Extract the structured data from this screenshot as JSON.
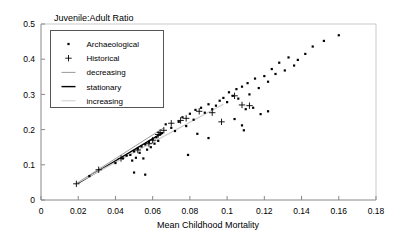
{
  "chart_data": {
    "type": "scatter",
    "title": "Juvenile:Adult Ratio",
    "xlabel": "Mean Childhood Mortality",
    "ylabel": "",
    "xlim": [
      0,
      0.18
    ],
    "ylim": [
      0,
      0.5
    ],
    "xticks": [
      0,
      0.02,
      0.04,
      0.06,
      0.08,
      0.1,
      0.12,
      0.14,
      0.16,
      0.18
    ],
    "xtick_labels": [
      "0",
      "0.02",
      "0.04",
      "0.06",
      "0.08",
      "0.1",
      "0.12",
      "0.14",
      "0.16",
      "0.18"
    ],
    "yticks": [
      0,
      0.1,
      0.2,
      0.3,
      0.4,
      0.5
    ],
    "ytick_labels": [
      "0",
      "0.1",
      "0.2",
      "0.3",
      "0.4",
      "0.5"
    ],
    "grid": false,
    "legend_position": "upper-left",
    "legend": [
      {
        "label": "Archaeological",
        "marker": "dot",
        "color": "#000000"
      },
      {
        "label": "Historical",
        "marker": "plus",
        "color": "#000000"
      },
      {
        "label": "decreasing",
        "marker": "line",
        "color": "#9a9a9a"
      },
      {
        "label": "stationary",
        "marker": "line",
        "color": "#000000"
      },
      {
        "label": "increasing",
        "marker": "line",
        "color": "#cccccc"
      }
    ],
    "series": [
      {
        "name": "Archaeological",
        "marker": "dot",
        "color": "#000000",
        "points": [
          [
            0.026,
            0.068
          ],
          [
            0.04,
            0.105
          ],
          [
            0.044,
            0.118
          ],
          [
            0.046,
            0.126
          ],
          [
            0.048,
            0.128
          ],
          [
            0.049,
            0.112
          ],
          [
            0.05,
            0.138
          ],
          [
            0.051,
            0.12
          ],
          [
            0.052,
            0.146
          ],
          [
            0.053,
            0.134
          ],
          [
            0.054,
            0.152
          ],
          [
            0.055,
            0.118
          ],
          [
            0.056,
            0.158
          ],
          [
            0.057,
            0.143
          ],
          [
            0.058,
            0.165
          ],
          [
            0.059,
            0.15
          ],
          [
            0.06,
            0.172
          ],
          [
            0.061,
            0.16
          ],
          [
            0.062,
            0.178
          ],
          [
            0.063,
            0.168
          ],
          [
            0.064,
            0.186
          ],
          [
            0.065,
            0.19
          ],
          [
            0.05,
            0.078
          ],
          [
            0.056,
            0.072
          ],
          [
            0.067,
            0.215
          ],
          [
            0.07,
            0.205
          ],
          [
            0.072,
            0.196
          ],
          [
            0.074,
            0.222
          ],
          [
            0.076,
            0.235
          ],
          [
            0.078,
            0.21
          ],
          [
            0.08,
            0.245
          ],
          [
            0.082,
            0.228
          ],
          [
            0.083,
            0.256
          ],
          [
            0.084,
            0.188
          ],
          [
            0.086,
            0.262
          ],
          [
            0.088,
            0.248
          ],
          [
            0.09,
            0.272
          ],
          [
            0.092,
            0.258
          ],
          [
            0.094,
            0.268
          ],
          [
            0.096,
            0.282
          ],
          [
            0.09,
            0.176
          ],
          [
            0.079,
            0.128
          ],
          [
            0.098,
            0.29
          ],
          [
            0.1,
            0.278
          ],
          [
            0.101,
            0.306
          ],
          [
            0.103,
            0.296
          ],
          [
            0.105,
            0.315
          ],
          [
            0.106,
            0.288
          ],
          [
            0.108,
            0.322
          ],
          [
            0.11,
            0.258
          ],
          [
            0.111,
            0.332
          ],
          [
            0.112,
            0.3
          ],
          [
            0.114,
            0.262
          ],
          [
            0.115,
            0.345
          ],
          [
            0.117,
            0.318
          ],
          [
            0.108,
            0.212
          ],
          [
            0.109,
            0.198
          ],
          [
            0.104,
            0.23
          ],
          [
            0.12,
            0.352
          ],
          [
            0.122,
            0.336
          ],
          [
            0.124,
            0.372
          ],
          [
            0.126,
            0.358
          ],
          [
            0.128,
            0.39
          ],
          [
            0.131,
            0.368
          ],
          [
            0.133,
            0.405
          ],
          [
            0.136,
            0.382
          ],
          [
            0.138,
            0.398
          ],
          [
            0.142,
            0.415
          ],
          [
            0.146,
            0.436
          ],
          [
            0.152,
            0.452
          ],
          [
            0.16,
            0.468
          ],
          [
            0.118,
            0.244
          ],
          [
            0.122,
            0.252
          ]
        ]
      },
      {
        "name": "Historical",
        "marker": "plus",
        "color": "#000000",
        "points": [
          [
            0.019,
            0.046
          ],
          [
            0.031,
            0.086
          ],
          [
            0.043,
            0.118
          ],
          [
            0.052,
            0.142
          ],
          [
            0.058,
            0.16
          ],
          [
            0.06,
            0.17
          ],
          [
            0.063,
            0.186
          ],
          [
            0.064,
            0.192
          ],
          [
            0.066,
            0.198
          ],
          [
            0.07,
            0.218
          ],
          [
            0.075,
            0.226
          ],
          [
            0.078,
            0.232
          ],
          [
            0.085,
            0.252
          ],
          [
            0.092,
            0.248
          ],
          [
            0.097,
            0.222
          ],
          [
            0.104,
            0.296
          ],
          [
            0.108,
            0.27
          ],
          [
            0.112,
            0.268
          ]
        ]
      }
    ],
    "lines": [
      {
        "name": "decreasing",
        "color": "#9a9a9a",
        "width": 1.0,
        "x0": 0.019,
        "y0": 0.047,
        "x1": 0.066,
        "y1": 0.205
      },
      {
        "name": "stationary",
        "color": "#000000",
        "width": 1.3,
        "x0": 0.02,
        "y0": 0.048,
        "x1": 0.065,
        "y1": 0.19
      },
      {
        "name": "increasing",
        "color": "#cccccc",
        "width": 1.2,
        "x0": 0.02,
        "y0": 0.05,
        "x1": 0.098,
        "y1": 0.272
      }
    ]
  }
}
